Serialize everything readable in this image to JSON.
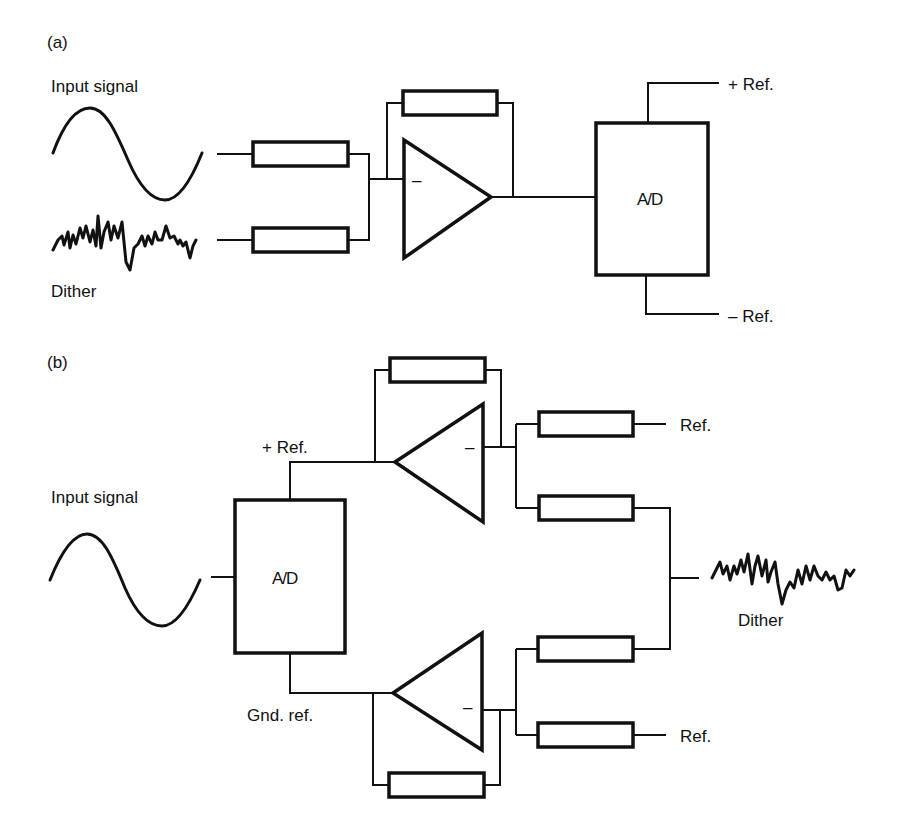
{
  "figure": {
    "panel_a": {
      "tag": "(a)",
      "input_label": "Input signal",
      "dither_label": "Dither",
      "converter_label": "A/D",
      "plus_ref_label": "+ Ref.",
      "minus_ref_label": "– Ref.",
      "opamp_sign": "–"
    },
    "panel_b": {
      "tag": "(b)",
      "input_label": "Input signal",
      "converter_label": "A/D",
      "plus_ref_label": "+ Ref.",
      "gnd_ref_label": "Gnd. ref.",
      "dither_label": "Dither",
      "ref_top_label": "Ref.",
      "ref_bottom_label": "Ref.",
      "opamp_sign": "–"
    }
  }
}
